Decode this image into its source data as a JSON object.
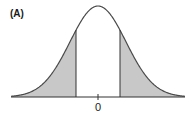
{
  "figure": {
    "panel_label": "(A)",
    "x_tick_label": "0"
  },
  "curve": {
    "type": "normal",
    "center_px": 98,
    "baseline_px": 97,
    "peak_px": 6,
    "sigma_px": 28,
    "x_start_px": 11,
    "x_end_px": 185
  },
  "shaded_regions": [
    {
      "name": "left-tail",
      "from_px": 11,
      "to_px": 76
    },
    {
      "name": "right-tail",
      "from_px": 120,
      "to_px": 185
    }
  ],
  "critical_lines_px": [
    76,
    120
  ],
  "colors": {
    "curve": "#4a4a4a",
    "shade": "#c8c8c8",
    "axis": "#333333",
    "background": "#ffffff"
  }
}
